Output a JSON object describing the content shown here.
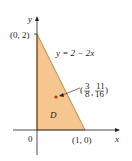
{
  "diagram": {
    "type": "region-plot",
    "region": {
      "name": "D",
      "vertices": [
        [
          0,
          0
        ],
        [
          0,
          2
        ],
        [
          1,
          0
        ]
      ],
      "fill_color": "#f5c78e",
      "edge_color": "#c8843a"
    },
    "curve": {
      "equation": "y = 2 − 2x",
      "label": "y = 2 − 2x"
    },
    "points": [
      {
        "label": "(0, 2)",
        "x": 0,
        "y": 2
      },
      {
        "label": "(1, 0)",
        "x": 1,
        "y": 0
      },
      {
        "label": "0",
        "x": 0,
        "y": 0
      }
    ],
    "centroid": {
      "x_num": "3",
      "x_den": "8",
      "y_num": "11",
      "y_den": "16",
      "color": "#d7261e"
    },
    "axes": {
      "x_label": "x",
      "y_label": "y"
    }
  }
}
